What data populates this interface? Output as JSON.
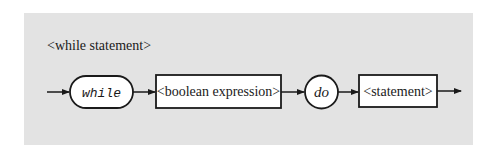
{
  "diagram": {
    "title": "<while statement>",
    "nodes": [
      {
        "id": "while",
        "shape": "rounded-pill",
        "label": "while",
        "style": "italic-monospace"
      },
      {
        "id": "boolean-expression",
        "shape": "rectangle",
        "label": "<boolean expression>"
      },
      {
        "id": "do",
        "shape": "circle",
        "label": "do",
        "style": "italic"
      },
      {
        "id": "statement",
        "shape": "rectangle",
        "label": "<statement>"
      }
    ],
    "edges": [
      {
        "from": "entry",
        "to": "while"
      },
      {
        "from": "while",
        "to": "boolean-expression"
      },
      {
        "from": "boolean-expression",
        "to": "do"
      },
      {
        "from": "do",
        "to": "statement"
      },
      {
        "from": "statement",
        "to": "exit"
      }
    ],
    "colors": {
      "panel_background": "#e3e3e3",
      "node_fill": "#ffffff",
      "stroke": "#1a1a1a"
    }
  }
}
